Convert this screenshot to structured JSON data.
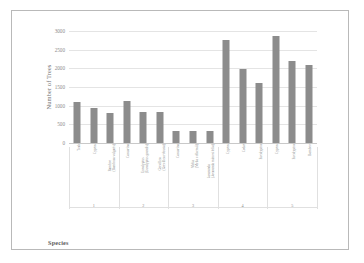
{
  "chart": {
    "type": "bar",
    "title": "",
    "xlabel": "Species",
    "ylabel": "Number of Trees",
    "bar_color": "#8c8c8c",
    "grid": true,
    "legend": "none"
  },
  "chart_data": {
    "type": "bar",
    "title": "",
    "xlabel": "Species",
    "ylabel": "Number of Trees",
    "ylim": [
      0,
      3000
    ],
    "yticks": [
      0,
      500,
      1000,
      1500,
      2000,
      2500,
      3000
    ],
    "ytick_labels": [
      "0",
      "500",
      "1000",
      "1500",
      "2000",
      "2500",
      "3000"
    ],
    "grid": true,
    "legend_position": "none",
    "categories": [
      "Teak",
      "Cyprus",
      "Bamboo\n(Bambusa vulgaris)",
      "Casuarina",
      "Eucalyptus\n(Eucalyptus grandis)",
      "Grevillea\n(Grevillea robusta)",
      "Casuarina",
      "Melia\n(Melia volkensii)",
      "Jacaranda\n(Jacaranda mimosifolia)",
      "Cyprus",
      "Cedar",
      "Eucalyptus",
      "Cyprus",
      "Eucalyptus",
      "Bamboo"
    ],
    "values": [
      1100,
      930,
      800,
      1120,
      820,
      820,
      330,
      320,
      320,
      2750,
      1980,
      1600,
      2860,
      2200,
      2100
    ],
    "groups": [
      {
        "label": "1",
        "start": 0,
        "end": 2
      },
      {
        "label": "2",
        "start": 3,
        "end": 5
      },
      {
        "label": "3",
        "start": 6,
        "end": 8
      },
      {
        "label": "4",
        "start": 9,
        "end": 11
      },
      {
        "label": "5",
        "start": 12,
        "end": 14
      }
    ]
  }
}
